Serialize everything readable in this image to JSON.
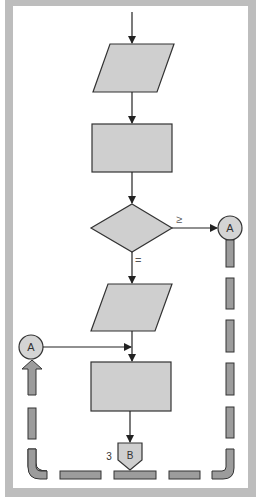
{
  "diagram": {
    "type": "flowchart",
    "colors": {
      "frame": "#b9b9b9",
      "background": "#ffffff",
      "shape_fill": "#cfcfcf",
      "stroke": "#333333",
      "dash_fill": "#9a9a9a"
    },
    "nodes": [
      {
        "id": "io1",
        "shape": "parallelogram",
        "label": ""
      },
      {
        "id": "process1",
        "shape": "rectangle",
        "label": ""
      },
      {
        "id": "decision1",
        "shape": "diamond",
        "label": ""
      },
      {
        "id": "connector_a_out",
        "shape": "circle-connector",
        "label": "A"
      },
      {
        "id": "io2",
        "shape": "parallelogram",
        "label": ""
      },
      {
        "id": "connector_a_in",
        "shape": "circle-connector",
        "label": "A"
      },
      {
        "id": "process2",
        "shape": "rectangle",
        "label": ""
      },
      {
        "id": "offpage_b",
        "shape": "offpage-connector",
        "label": "B",
        "page_ref": "3"
      }
    ],
    "edges": [
      {
        "from": "start",
        "to": "io1",
        "label": ""
      },
      {
        "from": "io1",
        "to": "process1",
        "label": ""
      },
      {
        "from": "process1",
        "to": "decision1",
        "label": ""
      },
      {
        "from": "decision1",
        "to": "connector_a_out",
        "label": "≥"
      },
      {
        "from": "decision1",
        "to": "io2",
        "label": "="
      },
      {
        "from": "io2",
        "to": "process2",
        "label": ""
      },
      {
        "from": "connector_a_in",
        "to": "process2",
        "label": ""
      },
      {
        "from": "process2",
        "to": "offpage_b",
        "label": ""
      },
      {
        "from": "connector_a_out",
        "to": "connector_a_in",
        "label": "",
        "style": "dashed-loop"
      }
    ],
    "labels": {
      "ge": "≥",
      "eq": "=",
      "connector_a_right": "A",
      "connector_a_left": "A",
      "offpage_b": "B",
      "offpage_page": "3"
    }
  }
}
